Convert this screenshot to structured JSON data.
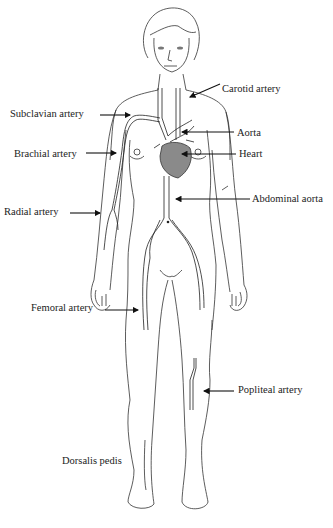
{
  "figure": {
    "heart_color": "#8a8a8a",
    "line_color": "#333333"
  },
  "labels": [
    {
      "id": "carotid",
      "text": "Carotid artery",
      "x": 222,
      "y": 83
    },
    {
      "id": "subclavian",
      "text": "Subclavian artery",
      "x": 10,
      "y": 108
    },
    {
      "id": "aorta",
      "text": "Aorta",
      "x": 237,
      "y": 127
    },
    {
      "id": "brachial",
      "text": "Brachial artery",
      "x": 14,
      "y": 148
    },
    {
      "id": "heart",
      "text": "Heart",
      "x": 239,
      "y": 148
    },
    {
      "id": "abdominal-aorta",
      "text": "Abdominal aorta",
      "x": 252,
      "y": 193
    },
    {
      "id": "radial",
      "text": "Radial artery",
      "x": 4,
      "y": 206
    },
    {
      "id": "femoral",
      "text": "Femoral artery",
      "x": 31,
      "y": 302
    },
    {
      "id": "popliteal",
      "text": "Popliteal artery",
      "x": 238,
      "y": 384
    },
    {
      "id": "dorsalis-pedis",
      "text": "Dorsalis pedis",
      "x": 62,
      "y": 455
    }
  ],
  "caption": {
    "text": "Figure: Arterial pulse points"
  }
}
